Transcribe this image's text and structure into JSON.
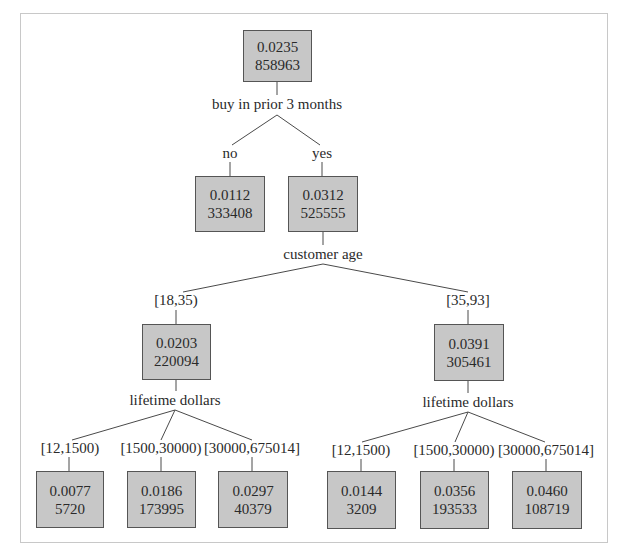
{
  "tree": {
    "root": {
      "rate": "0.0235",
      "count": "858963",
      "split": "buy in prior 3 months"
    },
    "level1": [
      {
        "edge": "no",
        "rate": "0.0112",
        "count": "333408"
      },
      {
        "edge": "yes",
        "rate": "0.0312",
        "count": "525555",
        "split": "customer age"
      }
    ],
    "level2": [
      {
        "edge": "[18,35)",
        "rate": "0.0203",
        "count": "220094",
        "split": "lifetime dollars"
      },
      {
        "edge": "[35,93]",
        "rate": "0.0391",
        "count": "305461",
        "split": "lifetime dollars"
      }
    ],
    "leaves_left": [
      {
        "edge": "[12,1500)",
        "rate": "0.0077",
        "count": "5720"
      },
      {
        "edge": "[1500,30000)",
        "rate": "0.0186",
        "count": "173995"
      },
      {
        "edge": "[30000,675014]",
        "rate": "0.0297",
        "count": "40379"
      }
    ],
    "leaves_right": [
      {
        "edge": "[12,1500)",
        "rate": "0.0144",
        "count": "3209"
      },
      {
        "edge": "[1500,30000)",
        "rate": "0.0356",
        "count": "193533"
      },
      {
        "edge": "[30000,675014]",
        "rate": "0.0460",
        "count": "108719"
      }
    ]
  },
  "colors": {
    "node_fill": "#c7c7c7",
    "node_border": "#555555",
    "edge": "#4a4a4a",
    "frame": "#c8c8c8"
  }
}
